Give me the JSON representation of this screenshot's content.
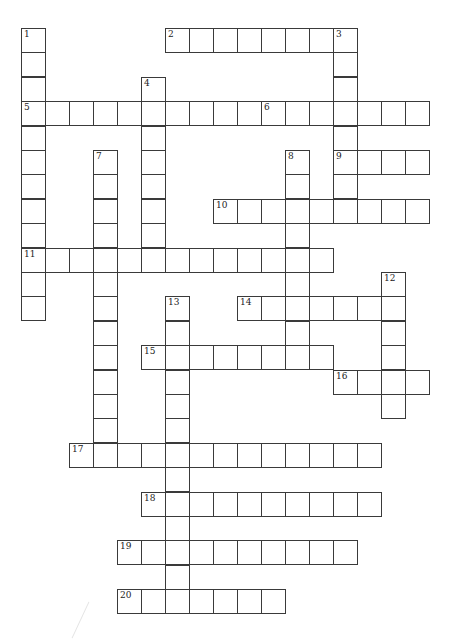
{
  "puzzle": {
    "type": "crossword",
    "grid": {
      "origin_x": 21,
      "origin_y": 28,
      "cell_w": 24,
      "cell_h": 24.4,
      "border_color": "#3a3a3a"
    },
    "words": [
      {
        "number": 1,
        "direction": "down",
        "row": 0,
        "col": 0,
        "length": 12
      },
      {
        "number": 2,
        "direction": "across",
        "row": 0,
        "col": 6,
        "length": 8
      },
      {
        "number": 3,
        "direction": "down",
        "row": 0,
        "col": 13,
        "length": 7
      },
      {
        "number": 4,
        "direction": "down",
        "row": 2,
        "col": 5,
        "length": 7
      },
      {
        "number": 5,
        "direction": "across",
        "row": 3,
        "col": 0,
        "length": 10
      },
      {
        "number": 6,
        "direction": "across",
        "row": 3,
        "col": 10,
        "length": 7
      },
      {
        "number": 7,
        "direction": "down",
        "row": 5,
        "col": 3,
        "length": 13
      },
      {
        "number": 8,
        "direction": "down",
        "row": 5,
        "col": 11,
        "length": 9
      },
      {
        "number": 9,
        "direction": "across",
        "row": 5,
        "col": 13,
        "length": 4
      },
      {
        "number": 10,
        "direction": "across",
        "row": 7,
        "col": 8,
        "length": 9
      },
      {
        "number": 11,
        "direction": "across",
        "row": 9,
        "col": 0,
        "length": 13
      },
      {
        "number": 12,
        "direction": "down",
        "row": 10,
        "col": 15,
        "length": 6
      },
      {
        "number": 13,
        "direction": "down",
        "row": 11,
        "col": 6,
        "length": 13
      },
      {
        "number": 14,
        "direction": "across",
        "row": 11,
        "col": 9,
        "length": 7
      },
      {
        "number": 15,
        "direction": "across",
        "row": 13,
        "col": 5,
        "length": 8
      },
      {
        "number": 16,
        "direction": "across",
        "row": 14,
        "col": 13,
        "length": 4
      },
      {
        "number": 17,
        "direction": "across",
        "row": 17,
        "col": 2,
        "length": 13
      },
      {
        "number": 18,
        "direction": "across",
        "row": 19,
        "col": 5,
        "length": 10
      },
      {
        "number": 19,
        "direction": "across",
        "row": 21,
        "col": 4,
        "length": 10
      },
      {
        "number": 20,
        "direction": "across",
        "row": 23,
        "col": 4,
        "length": 7
      }
    ]
  }
}
